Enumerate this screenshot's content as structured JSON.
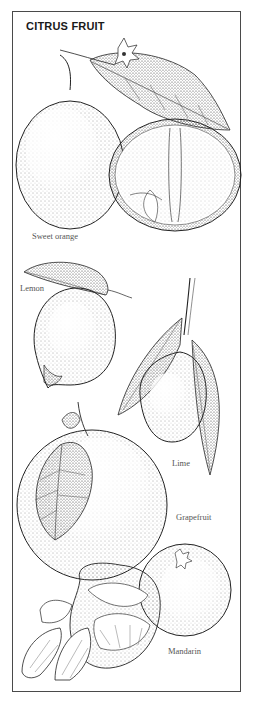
{
  "title": "CITRUS FRUIT",
  "labels": {
    "sweet_orange": "Sweet orange",
    "lemon": "Lemon",
    "lime": "Lime",
    "grapefruit": "Grapefruit",
    "mandarin": "Mandarin"
  },
  "colors": {
    "ink": "#1a1a1a",
    "label": "#555555",
    "border": "#4a4a4a",
    "background": "#ffffff"
  }
}
